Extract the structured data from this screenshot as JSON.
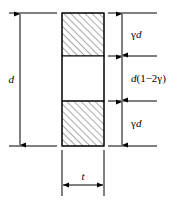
{
  "figure": {
    "type": "engineering-cross-section",
    "colors": {
      "line": "#000000",
      "background": "#ffffff",
      "hatch": "#555555"
    },
    "dimensions": {
      "overall_depth": {
        "label_gamma": "",
        "label_var": "d",
        "position": "left",
        "arrow_style": "double",
        "id": "d"
      },
      "top_zone": {
        "label_gamma": "γ",
        "label_var": "d",
        "position": "right",
        "arrow_style": "double",
        "id": "gamma-d-top"
      },
      "middle_zone": {
        "label_var": "d",
        "label_expr": "(1−2γ)",
        "position": "right",
        "arrow_style": "double",
        "id": "d-1-minus-2-gamma"
      },
      "bottom_zone": {
        "label_gamma": "γ",
        "label_var": "d",
        "position": "right",
        "arrow_style": "double",
        "id": "gamma-d-bottom"
      },
      "thickness": {
        "label_var": "t",
        "position": "bottom",
        "arrow_style": "double",
        "id": "t"
      }
    },
    "zones": [
      {
        "name": "top-flange",
        "hatched": true
      },
      {
        "name": "web-core",
        "hatched": false
      },
      {
        "name": "bottom-flange",
        "hatched": true
      }
    ]
  }
}
